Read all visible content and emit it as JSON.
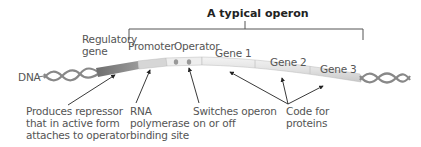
{
  "title": "A typical operon",
  "strand_label": "DNA",
  "regions": [
    {
      "id": "regulatory-gene",
      "label": "Regulatory gene",
      "lines": [
        "Regulatory",
        "gene"
      ],
      "color": "#8a8a8a"
    },
    {
      "id": "promoter",
      "label": "Promoter",
      "color": "#d9d9d9"
    },
    {
      "id": "operator",
      "label": "Operator",
      "color": "#ebebeb"
    },
    {
      "id": "gene-1",
      "label": "Gene 1",
      "color": "#e6e6e6"
    },
    {
      "id": "gene-2",
      "label": "Gene 2",
      "color": "#e6e6e6"
    },
    {
      "id": "gene-3",
      "label": "Gene 3",
      "color": "#e6e6e6"
    }
  ],
  "annotations": [
    {
      "id": "regulatory-note",
      "lines": [
        "Produces repressor",
        "that in active form",
        "attaches to operator"
      ]
    },
    {
      "id": "promoter-note",
      "lines": [
        "RNA",
        "polymerase",
        "binding site"
      ]
    },
    {
      "id": "operator-note",
      "lines": [
        "Switches operon",
        "on or off"
      ]
    },
    {
      "id": "genes-note",
      "lines": [
        "Code for",
        "proteins"
      ]
    }
  ]
}
